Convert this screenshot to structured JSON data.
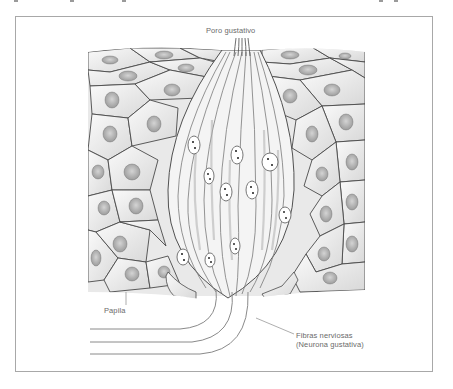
{
  "figure": {
    "labels": {
      "pore": "Poro gustativo",
      "papilla": "Papila",
      "nerve_fibers_line1": "Fibras nerviosas",
      "nerve_fibers_line2": "(Neurona gustativa)"
    },
    "colors": {
      "frame_border": "#a8a8a8",
      "ink": "#555555",
      "cell_fill": "#f2f2f2",
      "nucleus_fill": "#b9b9b9",
      "label_text": "#6a6a6a",
      "background": "#ffffff"
    }
  }
}
